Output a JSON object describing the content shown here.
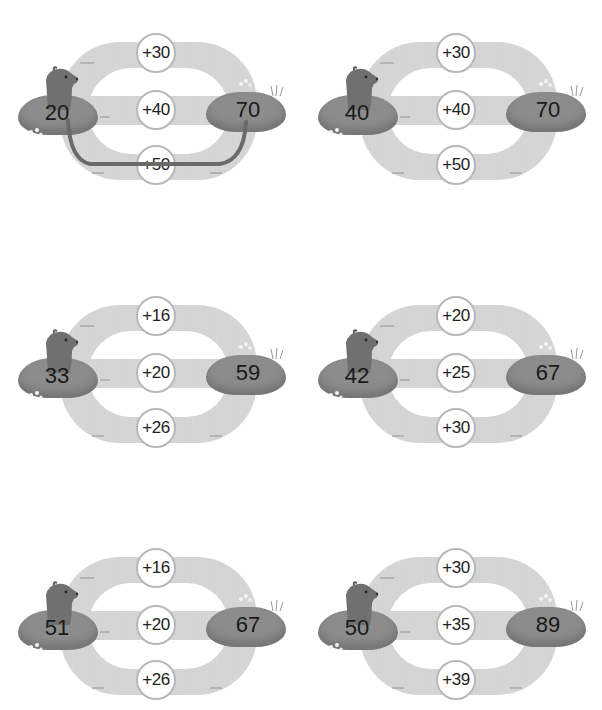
{
  "colors": {
    "track": "#d4d4d4",
    "circle_border": "#b8b8b8",
    "mound": "#8c8c8c",
    "bear": "#6e6e6e",
    "path": "#6a6a6a",
    "text": "#1a1a1a"
  },
  "puzzles": [
    {
      "start": "20",
      "end": "70",
      "options": [
        "+30",
        "+40",
        "+50"
      ],
      "solved_path": "+50"
    },
    {
      "start": "40",
      "end": "70",
      "options": [
        "+30",
        "+40",
        "+50"
      ]
    },
    {
      "start": "33",
      "end": "59",
      "options": [
        "+16",
        "+20",
        "+26"
      ]
    },
    {
      "start": "42",
      "end": "67",
      "options": [
        "+20",
        "+25",
        "+30"
      ]
    },
    {
      "start": "51",
      "end": "67",
      "options": [
        "+16",
        "+20",
        "+26"
      ]
    },
    {
      "start": "50",
      "end": "89",
      "options": [
        "+30",
        "+35",
        "+39"
      ]
    }
  ]
}
